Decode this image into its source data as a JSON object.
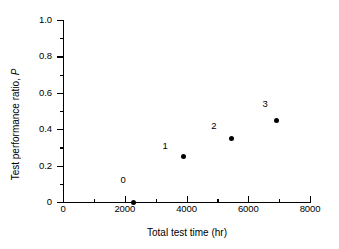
{
  "chart_data": {
    "type": "scatter",
    "title": "",
    "xlabel": "Total test time (hr)",
    "ylabel_text": "Test performance ratio, ",
    "ylabel_symbol": "P",
    "xlim": [
      0,
      8000
    ],
    "ylim": [
      0,
      1.0
    ],
    "grid": false,
    "legend": "none",
    "x_major_ticks": [
      {
        "value": 0,
        "label": "0"
      },
      {
        "value": 2000,
        "label": "2000"
      },
      {
        "value": 4000,
        "label": "4000"
      },
      {
        "value": 6000,
        "label": "6000"
      },
      {
        "value": 8000,
        "label": "8000"
      }
    ],
    "x_minor_ticks": [
      1000,
      3000,
      5000,
      7000
    ],
    "y_major_ticks": [
      {
        "value": 0,
        "label": "0"
      },
      {
        "value": 0.2,
        "label": "0.2"
      },
      {
        "value": 0.4,
        "label": "0.4"
      },
      {
        "value": 0.6,
        "label": "0.6"
      },
      {
        "value": 0.8,
        "label": "0.8"
      },
      {
        "value": 1.0,
        "label": "1.0"
      }
    ],
    "y_minor_ticks": [
      0.1,
      0.3,
      0.5,
      0.7,
      0.9
    ],
    "points": [
      {
        "label": "0",
        "x": 2270,
        "y": 0.0,
        "label_dx": -10,
        "label_dy": -22
      },
      {
        "label": "1",
        "x": 3890,
        "y": 0.25,
        "label_dx": -18,
        "label_dy": -11
      },
      {
        "label": "2",
        "x": 5470,
        "y": 0.35,
        "label_dx": -18,
        "label_dy": -12
      },
      {
        "label": "3",
        "x": 6900,
        "y": 0.45,
        "label_dx": -11,
        "label_dy": -16
      }
    ],
    "marker_color": "#000000",
    "axis_color": "#000000",
    "background_color": "#ffffff"
  }
}
